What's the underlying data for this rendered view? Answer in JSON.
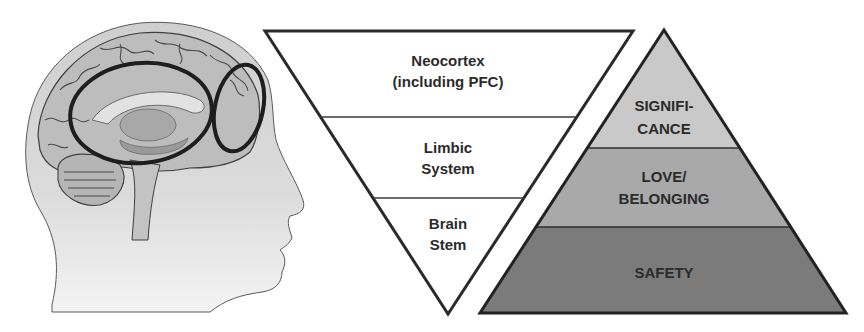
{
  "head_illustration": {
    "description": "Sagittal head profile with brain drawing",
    "highlights": [
      {
        "name": "limbic-region",
        "shape": "ellipse"
      },
      {
        "name": "prefrontal-region",
        "shape": "ellipse"
      }
    ]
  },
  "brain_triangle": {
    "orientation": "inverted",
    "layers": [
      {
        "lines": [
          "Neocortex",
          "(including PFC)"
        ]
      },
      {
        "lines": [
          "Limbic",
          "System"
        ]
      },
      {
        "lines": [
          "Brain",
          "Stem"
        ]
      }
    ]
  },
  "needs_pyramid": {
    "orientation": "upright",
    "layers": [
      {
        "lines": [
          "SIGNIFI-",
          "CANCE"
        ],
        "color": "#c9c9c9"
      },
      {
        "lines": [
          "LOVE/",
          "BELONGING"
        ],
        "color": "#a9a9a9"
      },
      {
        "lines": [
          "SAFETY"
        ],
        "color": "#7b7b7b"
      }
    ]
  },
  "colors": {
    "stroke": "#2a2a2a",
    "text": "#2b2b2b",
    "head_fill": "#d6d6d6",
    "brain_fill": "#bdbdbd"
  }
}
